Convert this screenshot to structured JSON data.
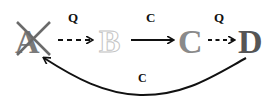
{
  "diagram": {
    "nodes": [
      {
        "id": "A",
        "label": "A",
        "style": "crossed",
        "color": "#7a7a7a"
      },
      {
        "id": "B",
        "label": "B",
        "style": "outline",
        "color": "#c8c8c8"
      },
      {
        "id": "C",
        "label": "C",
        "style": "filled",
        "color": "#8a8a8a"
      },
      {
        "id": "D",
        "label": "D",
        "style": "filled",
        "color": "#555555"
      }
    ],
    "edges": [
      {
        "from": "A",
        "to": "B",
        "label": "Q",
        "style": "dashed"
      },
      {
        "from": "B",
        "to": "C",
        "label": "C",
        "style": "solid"
      },
      {
        "from": "C",
        "to": "D",
        "label": "Q",
        "style": "dashed"
      },
      {
        "from": "D",
        "to": "A",
        "label": "C",
        "style": "curved-solid"
      }
    ],
    "colors": {
      "arrow": "#111111",
      "label": "#111111"
    }
  }
}
